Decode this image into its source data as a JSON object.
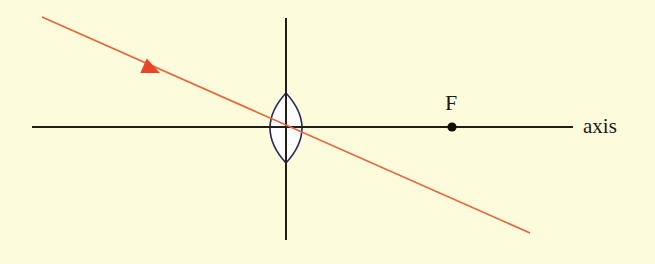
{
  "figure": {
    "width": 655,
    "height": 264,
    "background_color": "#fcfcdc"
  },
  "labels": {
    "axis": "axis",
    "focal_point": "F"
  },
  "colors": {
    "background": "#fcfcdc",
    "axis_line": "#1f1f16",
    "lens_plane_line": "#1f1f16",
    "lens_outline": "#2b2b5c",
    "lens_fill": "#fdfdfd",
    "ray": "#e8663c",
    "arrowhead": "#e8452a",
    "focal_dot": "#100f08",
    "text": "#1a1a14"
  },
  "geometry": {
    "optical_axis": {
      "name": "optical-axis",
      "x1": 32,
      "y1": 127,
      "x2": 573,
      "y2": 127,
      "stroke_width": 2
    },
    "lens_plane": {
      "name": "lens-plane",
      "x1": 286,
      "y1": 18,
      "x2": 286,
      "y2": 240,
      "stroke_width": 2
    },
    "lens": {
      "name": "biconvex-lens",
      "center_x": 286,
      "center_y": 128,
      "half_width": 16,
      "half_height": 35,
      "stroke_width": 1.6
    },
    "focal_point": {
      "name": "focal-point-F",
      "cx": 452,
      "cy": 127,
      "r": 4.6
    },
    "incident_ray": {
      "name": "incident-ray",
      "x1": 42,
      "y1": 17,
      "x2": 530,
      "y2": 233,
      "stroke_width": 1.7,
      "passes_through_center": true
    },
    "ray_arrowhead": {
      "name": "ray-direction-arrowhead",
      "tip_x": 160,
      "tip_y": 73,
      "length": 18,
      "half_width": 8,
      "angle_deg": 23.9
    }
  },
  "chart_data": {
    "type": "diagram",
    "elements": [
      {
        "name": "optical axis",
        "label": "axis",
        "orientation": "horizontal"
      },
      {
        "name": "lens plane",
        "label": "",
        "orientation": "vertical"
      },
      {
        "name": "biconvex lens",
        "label": "",
        "type": "converging"
      },
      {
        "name": "focal point",
        "label": "F",
        "side": "right of lens"
      },
      {
        "name": "incident ray",
        "label": "",
        "color": "#e8663c",
        "direction": "down-right"
      }
    ]
  }
}
